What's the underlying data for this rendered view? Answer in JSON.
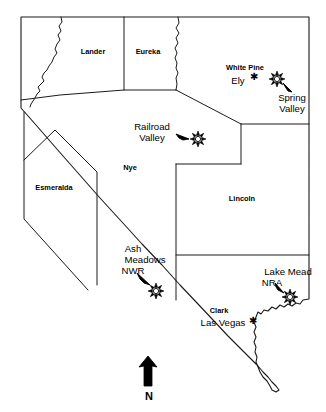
{
  "map": {
    "title": "Nevada",
    "colors": {
      "outline": "#1a1a1a",
      "county_line": "#1a1a1a",
      "background": "#ffffff",
      "text": "#000000",
      "marker": "#000000"
    },
    "counties": [
      {
        "id": "lander",
        "label": "Lander",
        "x": 93,
        "y": 54
      },
      {
        "id": "eureka",
        "label": "Eureka",
        "x": 148,
        "y": 54
      },
      {
        "id": "white-pine",
        "label": "White Pine",
        "x": 245,
        "y": 70
      },
      {
        "id": "nye",
        "label": "Nye",
        "x": 130,
        "y": 170
      },
      {
        "id": "esmeralda",
        "label": "Esmeralda",
        "x": 54,
        "y": 190
      },
      {
        "id": "lincoln",
        "label": "Lincoln",
        "x": 242,
        "y": 201
      },
      {
        "id": "clark",
        "label": "Clark",
        "x": 219,
        "y": 313
      }
    ],
    "cities": [
      {
        "id": "ely",
        "label": "Ely",
        "label_x": 238,
        "label_y": 84,
        "dot_x": 254,
        "dot_y": 77
      },
      {
        "id": "las-vegas",
        "label": "Las Vegas",
        "label_x": 223,
        "label_y": 326,
        "dot_x": 253,
        "dot_y": 321
      }
    ],
    "sites": [
      {
        "id": "spring-valley",
        "lines": [
          "Spring",
          "Valley"
        ],
        "label_x": 292,
        "label_y": 96,
        "star_x": 277,
        "star_y": 79,
        "arrow_from_x": 289,
        "arrow_from_y": 90,
        "arrow_to_x": 282,
        "arrow_to_y": 83
      },
      {
        "id": "railroad-valley",
        "lines": [
          "Railroad",
          "Valley"
        ],
        "label_x": 152,
        "label_y": 128,
        "star_x": 198,
        "star_y": 139,
        "arrow_from_x": 177,
        "arrow_from_y": 136,
        "arrow_to_x": 190,
        "arrow_to_y": 139
      },
      {
        "id": "ash-meadows-nwr",
        "lines": [
          "Ash",
          "Meadows",
          "NWR"
        ],
        "label_x": 140,
        "label_y": 250,
        "star_x": 156,
        "star_y": 291,
        "arrow_from_x": 140,
        "arrow_from_y": 274,
        "arrow_to_x": 150,
        "arrow_to_y": 285
      },
      {
        "id": "lake-mead-nra",
        "lines": [
          "Lake Mead",
          "NRA"
        ],
        "label_x": 287,
        "label_y": 273,
        "star_x": 290,
        "star_y": 297,
        "arrow_from_x": 277,
        "arrow_from_y": 284,
        "arrow_to_x": 284,
        "arrow_to_y": 292
      }
    ],
    "compass": {
      "label": "N",
      "label_x": 150,
      "label_y": 398,
      "arrow_x": 148,
      "arrow_top_y": 357,
      "arrow_bottom_y": 386
    }
  }
}
